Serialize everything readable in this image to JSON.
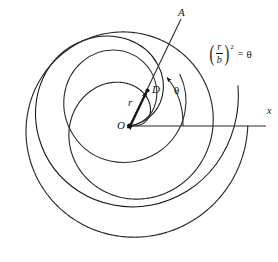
{
  "figure": {
    "type": "polar-spiral-diagram",
    "background_color": "#ffffff",
    "stroke_color": "#141414",
    "labels": {
      "origin": "O",
      "point_on_spiral": "D",
      "radius": "r",
      "angle": "θ",
      "axis": "x",
      "ray_end": "A"
    },
    "equation": {
      "numerator": "r",
      "denominator": "b",
      "exponent": "2",
      "equals": "=",
      "right_side": "θ",
      "plain": "(r/b)² = θ"
    },
    "geometry": {
      "origin_px": [
        129,
        126
      ],
      "point_D_px": [
        148,
        90
      ],
      "ray_A_tip_px": [
        181,
        19
      ],
      "x_axis_end_px": [
        266,
        126
      ],
      "theta_degrees": 62,
      "spiral_turns": 2
    }
  },
  "chart_data": {
    "type": "line",
    "xlabel": "x",
    "ylabel": "",
    "grid": false,
    "legend": "none",
    "curve": {
      "name": "Fermat spiral",
      "polar_equation": "r = b√θ",
      "theta_range_radians": [
        0,
        12.566
      ],
      "b_scale_px": 33.5
    },
    "annotations": [
      {
        "label": "O",
        "role": "origin",
        "theta": 0,
        "r": 0
      },
      {
        "label": "D",
        "role": "point-on-spiral",
        "theta_degrees": 62,
        "r_px": 40.7
      },
      {
        "label": "r",
        "role": "radius-vector"
      },
      {
        "label": "θ",
        "role": "polar-angle-arc",
        "degrees": 62
      },
      {
        "label": "A",
        "role": "ray-terminus"
      },
      {
        "label": "x",
        "role": "axis-label"
      }
    ]
  }
}
